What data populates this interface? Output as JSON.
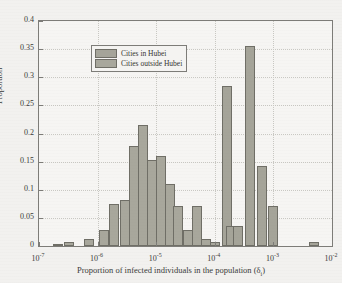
{
  "chart_data": {
    "type": "bar",
    "title": "",
    "xlabel": "Proportion of infected individuals in the population (δ",
    "xlabel_sub": "i",
    "xlabel_close": ")",
    "ylabel": "Proportion",
    "xscale": "log",
    "xlim": [
      1e-07,
      0.01
    ],
    "ylim": [
      0,
      0.4
    ],
    "grid": true,
    "legend_position": "top-left",
    "xticks": [
      {
        "label": "10",
        "exp": "-7",
        "value": 1e-07
      },
      {
        "label": "10",
        "exp": "-6",
        "value": 1e-06
      },
      {
        "label": "10",
        "exp": "-5",
        "value": 1e-05
      },
      {
        "label": "10",
        "exp": "-4",
        "value": 0.0001
      },
      {
        "label": "10",
        "exp": "-3",
        "value": 0.001
      },
      {
        "label": "10",
        "exp": "-2",
        "value": 0.01
      }
    ],
    "yticks": [
      "0",
      "0.05",
      "0.1",
      "0.15",
      "0.2",
      "0.25",
      "0.3",
      "0.35",
      "0.4"
    ],
    "ytick_values": [
      0,
      0.05,
      0.1,
      0.15,
      0.2,
      0.25,
      0.3,
      0.35,
      0.4
    ],
    "series": [
      {
        "name": "Cities in Hubei",
        "color": "#a5a499",
        "bars": [
          {
            "x_center": 0.00016,
            "value": 0.285
          },
          {
            "x_center": 0.0004,
            "value": 0.355
          },
          {
            "x_center": 0.00063,
            "value": 0.143
          },
          {
            "x_center": 0.001,
            "value": 0.071
          },
          {
            "x_center": 0.00019,
            "value": 0.036
          },
          {
            "x_center": 0.00025,
            "value": 0.036
          },
          {
            "x_center": 5e-05,
            "value": 0.036
          },
          {
            "x_center": 0.005,
            "value": 0.007
          }
        ]
      },
      {
        "name": "Cities outside Hubei",
        "color": "#a8a79c",
        "bars": [
          {
            "x_center": 2.1e-07,
            "value": 0.004
          },
          {
            "x_center": 3.2e-07,
            "value": 0.008
          },
          {
            "x_center": 7e-07,
            "value": 0.012
          },
          {
            "x_center": 1.3e-06,
            "value": 0.028
          },
          {
            "x_center": 1.9e-06,
            "value": 0.075
          },
          {
            "x_center": 2.9e-06,
            "value": 0.081
          },
          {
            "x_center": 4.2e-06,
            "value": 0.178
          },
          {
            "x_center": 6e-06,
            "value": 0.215
          },
          {
            "x_center": 8.5e-06,
            "value": 0.153
          },
          {
            "x_center": 1.2e-05,
            "value": 0.16
          },
          {
            "x_center": 1.7e-05,
            "value": 0.11
          },
          {
            "x_center": 2.4e-05,
            "value": 0.072
          },
          {
            "x_center": 3.5e-05,
            "value": 0.029
          },
          {
            "x_center": 4.9e-05,
            "value": 0.072
          },
          {
            "x_center": 7e-05,
            "value": 0.012
          },
          {
            "x_center": 0.0001,
            "value": 0.008
          }
        ]
      }
    ]
  },
  "legend": {
    "items": [
      {
        "label": "Cities in Hubei"
      },
      {
        "label": "Cities outside Hubei"
      }
    ]
  }
}
